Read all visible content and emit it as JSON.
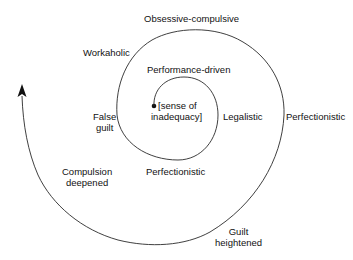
{
  "diagram": {
    "type": "spiral",
    "colors": {
      "line": "#2a2a2a",
      "text": "#111111",
      "background": "#ffffff"
    },
    "center_label": "[sense of inadequacy]",
    "labels": {
      "obsessive": "Obsessive-compulsive",
      "workaholic": "Workaholic",
      "performance": "Performance-driven",
      "center_line1": "[sense of",
      "center_line2": "inadequacy]",
      "false_line1": "False",
      "false_line2": "guilt",
      "legalistic": "Legalistic",
      "perfectionistic_outer": "Perfectionistic",
      "perfectionistic_inner": "Perfectionistic",
      "compulsion_line1": "Compulsion",
      "compulsion_line2": "deepened",
      "guilt_line1": "Guilt",
      "guilt_line2": "heightened"
    },
    "sequence": [
      "[sense of inadequacy]",
      "Performance-driven",
      "Legalistic",
      "Perfectionistic",
      "False guilt",
      "Workaholic",
      "Obsessive-compulsive",
      "Perfectionistic",
      "Guilt heightened",
      "Compulsion deepened"
    ]
  }
}
